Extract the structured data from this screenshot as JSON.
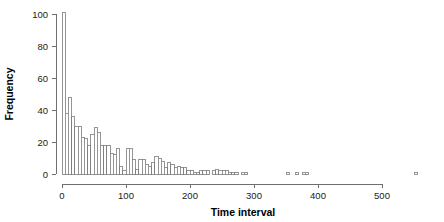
{
  "chart_data": {
    "type": "bar",
    "title": "",
    "subtitle": "",
    "xlabel": "Time interval",
    "ylabel": "Frequency",
    "xlim": [
      0,
      560
    ],
    "ylim": [
      0,
      104
    ],
    "grid": false,
    "legend": null,
    "bin_width": 5,
    "xticks": [
      0,
      100,
      200,
      300,
      400,
      500
    ],
    "xtick_labels": [
      "0",
      "100",
      "200",
      "300",
      "400",
      "500"
    ],
    "yticks": [
      0,
      20,
      40,
      60,
      80,
      100
    ],
    "ytick_labels": [
      "0",
      "20",
      "40",
      "60",
      "80",
      "100"
    ],
    "bar_fill": "#ffffff",
    "bar_stroke": "#7a7a7a",
    "axis_color": "#6e6e6e",
    "bin_starts": [
      0,
      5,
      10,
      15,
      20,
      25,
      30,
      35,
      40,
      45,
      50,
      55,
      60,
      65,
      70,
      75,
      80,
      85,
      90,
      95,
      100,
      105,
      110,
      115,
      120,
      125,
      130,
      135,
      140,
      145,
      150,
      155,
      160,
      165,
      170,
      175,
      180,
      185,
      190,
      195,
      200,
      205,
      210,
      215,
      220,
      225,
      230,
      235,
      240,
      245,
      250,
      255,
      260,
      265,
      270,
      275,
      280,
      285,
      290,
      295,
      300,
      305,
      310,
      315,
      320,
      325,
      330,
      335,
      340,
      345,
      350,
      355,
      360,
      365,
      370,
      375,
      380,
      385,
      390,
      395,
      400,
      405,
      410,
      415,
      420,
      425,
      430,
      435,
      440,
      445,
      450,
      455,
      460,
      465,
      470,
      475,
      480,
      485,
      490,
      495,
      500,
      505,
      510,
      515,
      520,
      525,
      530,
      535,
      540,
      545,
      550
    ],
    "values": [
      101,
      38,
      48,
      36,
      30,
      30,
      23,
      22,
      18,
      25,
      29,
      26,
      18,
      18,
      18,
      13,
      12,
      16,
      5,
      2,
      16,
      16,
      9,
      3,
      9,
      9,
      6,
      5,
      7,
      11,
      10,
      8,
      4,
      7,
      6,
      4,
      5,
      4,
      4,
      2,
      2,
      1,
      1,
      2,
      2,
      2,
      0,
      2,
      3,
      2,
      2,
      2,
      1,
      1,
      1,
      0,
      1,
      1,
      0,
      0,
      0,
      0,
      0,
      0,
      0,
      0,
      0,
      0,
      0,
      0,
      1,
      0,
      0,
      1,
      0,
      1,
      1,
      0,
      0,
      0,
      0,
      0,
      0,
      0,
      0,
      0,
      0,
      0,
      0,
      0,
      0,
      0,
      0,
      0,
      0,
      0,
      0,
      0,
      0,
      0,
      0,
      0,
      0,
      0,
      0,
      0,
      0,
      0,
      0,
      0,
      1
    ]
  }
}
